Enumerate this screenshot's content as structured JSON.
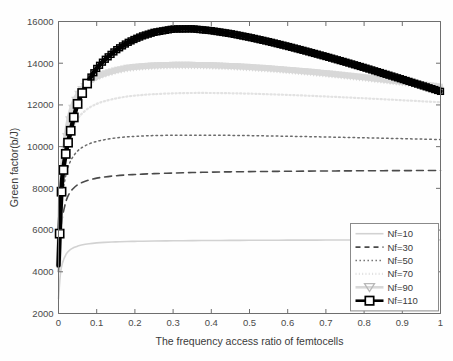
{
  "chart_data": {
    "type": "line",
    "title": "",
    "xlabel": "The frequency access ratio of femtocells",
    "ylabel": "Green factor(b/J)",
    "xlim": [
      0,
      1
    ],
    "ylim": [
      2000,
      16000
    ],
    "xticks": [
      "0",
      "0.1",
      "0.2",
      "0.3",
      "0.4",
      "0.5",
      "0.6",
      "0.7",
      "0.8",
      "0.9",
      "1"
    ],
    "yticks": [
      "2000",
      "4000",
      "6000",
      "8000",
      "10000",
      "12000",
      "14000",
      "16000"
    ],
    "grid": false,
    "legend_position": "lower-right",
    "x": [
      0,
      0.005,
      0.01,
      0.02,
      0.03,
      0.04,
      0.05,
      0.06,
      0.08,
      0.1,
      0.12,
      0.15,
      0.18,
      0.2,
      0.22,
      0.25,
      0.3,
      0.35,
      0.4,
      0.45,
      0.5,
      0.55,
      0.6,
      0.65,
      0.7,
      0.75,
      0.8,
      0.85,
      0.9,
      0.95,
      1
    ],
    "series": [
      {
        "name": "Nf=10",
        "label": "Nf=10",
        "style": "solid",
        "color": "#d2d2d2",
        "width": 1.6,
        "marker": "none",
        "values": [
          2700,
          3900,
          4400,
          4850,
          5050,
          5160,
          5230,
          5280,
          5345,
          5385,
          5410,
          5435,
          5452,
          5460,
          5467,
          5475,
          5487,
          5495,
          5501,
          5506,
          5510,
          5513,
          5516,
          5519,
          5521,
          5523,
          5525,
          5527,
          5528,
          5529,
          5530
        ]
      },
      {
        "name": "Nf=30",
        "label": "Nf=30",
        "style": "dashed",
        "color": "#4a4a4a",
        "width": 1.6,
        "marker": "none",
        "values": [
          4000,
          5700,
          6600,
          7400,
          7800,
          8020,
          8170,
          8270,
          8400,
          8490,
          8545,
          8605,
          8645,
          8665,
          8683,
          8705,
          8735,
          8760,
          8778,
          8792,
          8803,
          8812,
          8820,
          8827,
          8833,
          8838,
          8843,
          8847,
          8851,
          8854,
          8857
        ]
      },
      {
        "name": "Nf=50",
        "label": "Nf=50",
        "style": "dotted",
        "color": "#6a6a6a",
        "width": 1.5,
        "marker": "none",
        "values": [
          4200,
          6400,
          7600,
          8700,
          9250,
          9570,
          9790,
          9940,
          10130,
          10250,
          10330,
          10415,
          10470,
          10495,
          10512,
          10530,
          10548,
          10552,
          10548,
          10540,
          10528,
          10514,
          10498,
          10481,
          10463,
          10444,
          10424,
          10404,
          10383,
          10362,
          10340
        ]
      },
      {
        "name": "Nf=70",
        "label": "Nf=70",
        "style": "dotted-fine",
        "color": "#e2e2e2",
        "width": 2.2,
        "marker": "none",
        "values": [
          4250,
          6800,
          8300,
          9700,
          10500,
          10990,
          11320,
          11560,
          11860,
          12050,
          12175,
          12310,
          12405,
          12445,
          12478,
          12515,
          12555,
          12572,
          12572,
          12560,
          12540,
          12512,
          12480,
          12444,
          12404,
          12362,
          12318,
          12272,
          12224,
          12176,
          12126
        ]
      },
      {
        "name": "Nf=90",
        "label": "Nf=90",
        "style": "marker-band",
        "color": "#d8d8d8",
        "width": 5.5,
        "marker": "triangle-down",
        "values": [
          4300,
          7100,
          8900,
          10500,
          11500,
          12080,
          12470,
          12750,
          13110,
          13340,
          13490,
          13650,
          13765,
          13810,
          13845,
          13880,
          13910,
          13910,
          13890,
          13855,
          13805,
          13745,
          13675,
          13595,
          13508,
          13413,
          13312,
          13205,
          13093,
          12976,
          12855
        ]
      },
      {
        "name": "Nf=110",
        "label": "Nf=110",
        "style": "solid-marker",
        "color": "#000000",
        "width": 4.5,
        "marker": "square",
        "values": [
          4300,
          6850,
          8500,
          9780,
          10600,
          11400,
          12050,
          12500,
          13200,
          13750,
          14150,
          14620,
          14980,
          15160,
          15310,
          15480,
          15640,
          15650,
          15560,
          15420,
          15240,
          15035,
          14810,
          14570,
          14320,
          14060,
          13790,
          13510,
          13230,
          12940,
          12650
        ]
      }
    ],
    "marker_x": [
      0.003,
      0.008,
      0.013,
      0.019,
      0.025,
      0.032,
      0.04,
      0.05,
      0.062,
      0.075
    ]
  },
  "legend": {
    "entries": [
      {
        "label": "Nf=10"
      },
      {
        "label": "Nf=30"
      },
      {
        "label": "Nf=50"
      },
      {
        "label": "Nf=70"
      },
      {
        "label": "Nf=90"
      },
      {
        "label": "Nf=110"
      }
    ]
  }
}
